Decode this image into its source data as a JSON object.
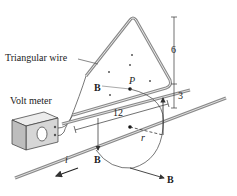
{
  "labels": {
    "triangular_wire": "Triangular wire",
    "volt_meter": "Volt meter",
    "field_B_inside": "B",
    "field_B_down": "B",
    "field_B_right": "B",
    "point_P": "P",
    "current_i": "i",
    "radius_r": "r"
  },
  "dimensions": {
    "height_upper": "6",
    "height_lower": "3",
    "length_base": "12"
  },
  "colors": {
    "wire": "#8a8a8a",
    "line": "#333333",
    "meter_front": "#d6d6d6",
    "meter_top": "#ececec",
    "meter_side": "#bdbdbd"
  }
}
